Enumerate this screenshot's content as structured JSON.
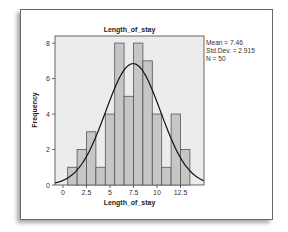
{
  "chart_data": {
    "type": "bar",
    "title": "Length_of_stay",
    "xlabel": "Length_of_stay",
    "ylabel": "Frequency",
    "categories": [
      1,
      2,
      3,
      4,
      5,
      6,
      7,
      8,
      9,
      10,
      11,
      12,
      13
    ],
    "values": [
      1,
      2,
      3,
      1,
      4,
      8,
      5,
      8,
      7,
      4,
      1,
      4,
      2
    ],
    "bin_width": 1,
    "x_ticks": [
      "0",
      "2.5",
      "5",
      "7.5",
      "10",
      "12.5"
    ],
    "y_ticks": [
      "0",
      "2",
      "4",
      "6",
      "8"
    ],
    "xlim": [
      -0.85,
      15
    ],
    "ylim": [
      0,
      8.4
    ],
    "grid": false,
    "overlay": {
      "type": "normal_curve",
      "mean": 7.46,
      "std_dev": 2.915,
      "n": 50
    },
    "annotations": [
      "Mean = 7.46",
      "Std.Dev. = 2.915",
      "N = 50"
    ],
    "colors": {
      "bar_fill": "#c6c6c6",
      "bar_edge": "#555555",
      "plot_bg": "#ececec",
      "curve": "#111111"
    }
  },
  "stats": {
    "mean": "Mean = 7.46",
    "std_dev": "Std.Dev. = 2.915",
    "n": "N = 50"
  }
}
